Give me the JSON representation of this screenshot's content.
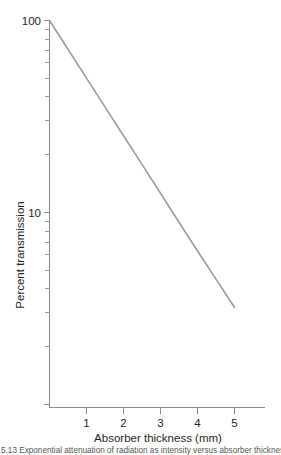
{
  "figure": {
    "background_color": "#ffffff",
    "line_color": "#9c9c9c",
    "axis_color": "#8a8a8a",
    "text_color": "#1f1f1f",
    "caption": "5.13  Exponential attenuation of radiation as intensity versus absorber thickness"
  },
  "chart_data": {
    "type": "line",
    "title": "",
    "subtitle": "",
    "xlabel": "Absorber thickness (mm)",
    "ylabel": "Percent transmission",
    "xscale": "linear",
    "yscale": "log",
    "xlim": [
      0,
      5.85
    ],
    "ylim": [
      1,
      100
    ],
    "grid": false,
    "legend": null,
    "legend_position": "none",
    "x_ticks": [
      1,
      2,
      3,
      4,
      5
    ],
    "x_tick_labels": [
      "1",
      "2",
      "3",
      "4",
      "5"
    ],
    "y_ticks": [
      100,
      10
    ],
    "y_tick_labels": [
      "100",
      "10"
    ],
    "y_minor_ticks": [
      90,
      80,
      70,
      60,
      50,
      40,
      30,
      20,
      9,
      8,
      7,
      6,
      5,
      4,
      3,
      2,
      1
    ],
    "series": [
      {
        "name": "Transmission",
        "x": [
          0,
          0.5,
          1,
          1.5,
          2,
          2.5,
          3,
          3.5,
          4,
          4.5,
          5
        ],
        "y": [
          100,
          70.8,
          50.1,
          35.5,
          25.1,
          17.8,
          12.6,
          8.9,
          6.3,
          4.5,
          3.2
        ]
      }
    ],
    "annotations": []
  },
  "axes": {
    "y_label_top": "100",
    "y_label_decade": "10",
    "y_title": "Percent transmission",
    "x_title": "Absorber thickness (mm)",
    "x_labels": [
      "1",
      "2",
      "3",
      "4",
      "5"
    ]
  }
}
